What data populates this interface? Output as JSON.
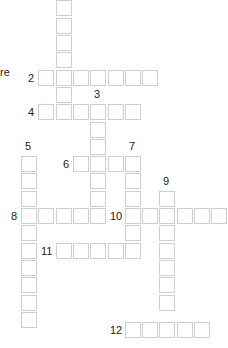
{
  "puzzle": {
    "left_fragment_text": "re",
    "grid": {
      "origin_x": 21,
      "origin_y": 208,
      "pitch": 17.3,
      "ref_row": 12
    },
    "words": [
      {
        "number": "1",
        "direction": "down",
        "col": 2,
        "row": 0,
        "length": 7,
        "show_number": false
      },
      {
        "number": "2",
        "direction": "across",
        "col": 1,
        "row": 4,
        "length": 7,
        "show_number": true
      },
      {
        "number": "3",
        "direction": "down",
        "col": 4,
        "row": 6,
        "length": 7,
        "show_number": true
      },
      {
        "number": "4",
        "direction": "across",
        "col": 1,
        "row": 6,
        "length": 6,
        "show_number": true
      },
      {
        "number": "5",
        "direction": "down",
        "col": 0,
        "row": 9,
        "length": 10,
        "show_number": true
      },
      {
        "number": "6",
        "direction": "across",
        "col": 3,
        "row": 9,
        "length": 4,
        "show_number": true
      },
      {
        "number": "7",
        "direction": "down",
        "col": 6,
        "row": 9,
        "length": 6,
        "show_number": true
      },
      {
        "number": "8",
        "direction": "across",
        "col": 0,
        "row": 12,
        "length": 5,
        "show_number": true
      },
      {
        "number": "9",
        "direction": "down",
        "col": 8,
        "row": 11,
        "length": 7,
        "show_number": true
      },
      {
        "number": "10",
        "direction": "across",
        "col": 6,
        "row": 12,
        "length": 6,
        "show_number": true
      },
      {
        "number": "11",
        "direction": "across",
        "col": 2,
        "row": 14,
        "length": 5,
        "show_number": true
      },
      {
        "number": "12",
        "direction": "across",
        "col": 6,
        "row": 18.6,
        "length": 5,
        "show_number": true
      }
    ]
  }
}
